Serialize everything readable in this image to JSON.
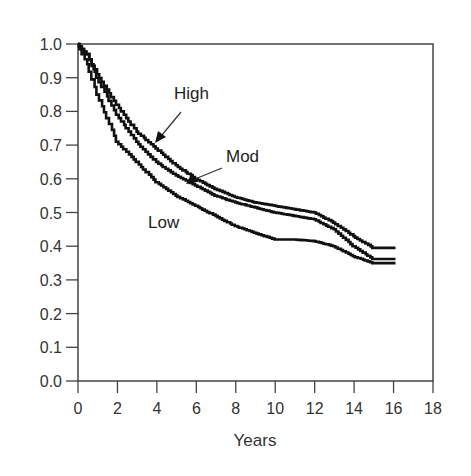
{
  "chart_data": {
    "type": "line",
    "subtype": "kaplan-meier-step",
    "title": "",
    "xlabel": "Years",
    "ylabel": "",
    "xlim": [
      0,
      18
    ],
    "ylim": [
      0.0,
      1.0
    ],
    "x_ticks": [
      "0",
      "2",
      "4",
      "6",
      "8",
      "10",
      "12",
      "14",
      "16",
      "18"
    ],
    "y_ticks": [
      "0.0",
      "0.1",
      "0.2",
      "0.3",
      "0.4",
      "0.5",
      "0.6",
      "0.7",
      "0.8",
      "0.9",
      "1.0"
    ],
    "grid": false,
    "legend": "inline labels with arrows",
    "x": [
      0,
      0.5,
      1,
      2,
      3,
      4,
      5,
      6,
      7,
      8,
      9,
      10,
      11,
      12,
      13,
      14,
      15,
      16.1
    ],
    "series": [
      {
        "name": "High",
        "values": [
          1.0,
          0.97,
          0.91,
          0.82,
          0.74,
          0.69,
          0.64,
          0.6,
          0.57,
          0.546,
          0.53,
          0.52,
          0.51,
          0.5,
          0.47,
          0.43,
          0.395,
          0.395
        ]
      },
      {
        "name": "Mod",
        "values": [
          1.0,
          0.97,
          0.9,
          0.79,
          0.71,
          0.65,
          0.61,
          0.58,
          0.55,
          0.53,
          0.515,
          0.5,
          0.49,
          0.48,
          0.45,
          0.4,
          0.362,
          0.362
        ]
      },
      {
        "name": "Low",
        "values": [
          1.0,
          0.94,
          0.85,
          0.71,
          0.65,
          0.59,
          0.55,
          0.52,
          0.49,
          0.46,
          0.44,
          0.42,
          0.42,
          0.415,
          0.4,
          0.37,
          0.35,
          0.35
        ]
      }
    ],
    "annotations": [
      {
        "text": "High",
        "x": 5.0,
        "y": 0.9
      },
      {
        "text": "Mod",
        "x": 7.5,
        "y": 0.68
      },
      {
        "text": "Low",
        "x": 3.6,
        "y": 0.5
      }
    ]
  },
  "labels": {
    "high": "High",
    "mod": "Mod",
    "low": "Low",
    "xlabel": "Years"
  }
}
